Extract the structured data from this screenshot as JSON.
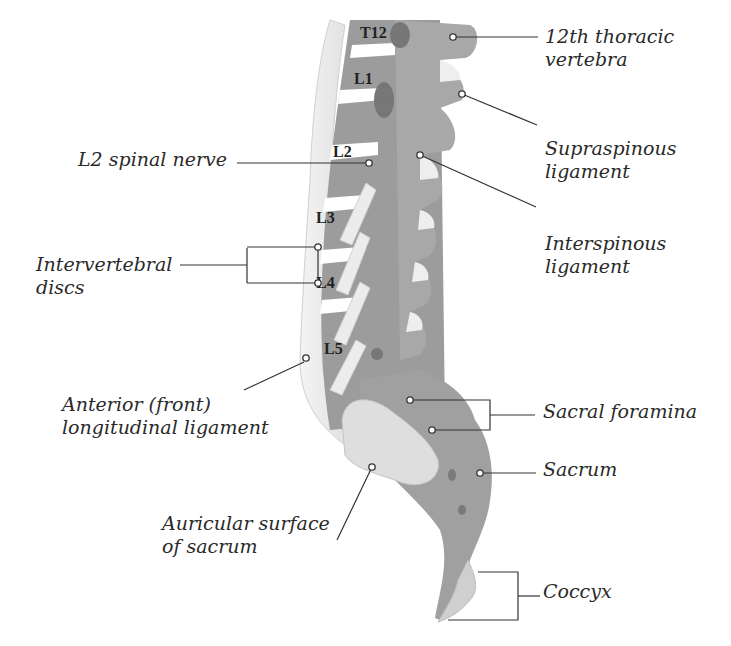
{
  "colors": {
    "bone": "#9a9a9a",
    "bone_dark": "#808080",
    "ligament": "#e8e8e8",
    "disc": "#ffffff",
    "line": "#333333",
    "text": "#2a2a2a"
  },
  "vertebra_labels": [
    "T12",
    "L1",
    "L2",
    "L3",
    "L4",
    "L5"
  ],
  "labels": {
    "thoracic_12": {
      "line1": "12th thoracic",
      "line2": "vertebra"
    },
    "supraspinous": {
      "line1": "Supraspinous",
      "line2": "ligament"
    },
    "interspinous": {
      "line1": "Interspinous",
      "line2": "ligament"
    },
    "l2_nerve": {
      "line1": "L2 spinal nerve"
    },
    "discs": {
      "line1": "Intervertebral",
      "line2": "discs"
    },
    "anterior_ligament": {
      "line1": "Anterior (front)",
      "line2": "longitudinal ligament"
    },
    "sacral_foramina": {
      "line1": "Sacral foramina"
    },
    "sacrum": {
      "line1": "Sacrum"
    },
    "auricular": {
      "line1": "Auricular surface",
      "line2": "of sacrum"
    },
    "coccyx": {
      "line1": "Coccyx"
    }
  }
}
